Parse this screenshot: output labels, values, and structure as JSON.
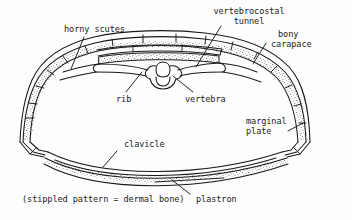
{
  "figure": {
    "background_color": "#fdfdfd",
    "ink_color": "#1a1a1a",
    "stipple_color": "#5a5a5a"
  },
  "labels": {
    "horny_scutes": "horny scutes",
    "vertebrocostal_line1": "vertebrocostal",
    "vertebrocostal_line2": "tunnel",
    "bony_line1": "bony",
    "bony_line2": "carapace",
    "rib": "rib",
    "vertebra": "vertebra",
    "marginal_line1": "marginal",
    "marginal_line2": "plate",
    "clavicle": "clavicle",
    "plastron": "plastron",
    "key_note": "(stippled pattern = dermal bone)"
  },
  "parts": [
    {
      "name": "horny-scutes",
      "label": "horny scutes"
    },
    {
      "name": "vertebrocostal-tunnel",
      "label": "vertebrocostal tunnel"
    },
    {
      "name": "bony-carapace",
      "label": "bony carapace"
    },
    {
      "name": "rib",
      "label": "rib"
    },
    {
      "name": "vertebra",
      "label": "vertebra"
    },
    {
      "name": "marginal-plate",
      "label": "marginal plate"
    },
    {
      "name": "clavicle",
      "label": "clavicle"
    },
    {
      "name": "plastron",
      "label": "plastron"
    }
  ]
}
